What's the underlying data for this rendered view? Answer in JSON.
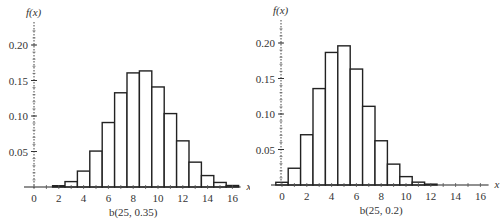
{
  "chart_data": [
    {
      "type": "bar",
      "title": "b(25, 0.35)",
      "xlabel": "x",
      "ylabel": "f(x)",
      "ylim": [
        0,
        0.23
      ],
      "xlim": [
        -0.5,
        16.5
      ],
      "x_ticks": [
        0,
        2,
        4,
        6,
        8,
        10,
        12,
        14,
        16
      ],
      "y_ticks": [
        "0.05",
        "0.10",
        "0.15",
        "0.20"
      ],
      "grid": false,
      "categories": [
        0,
        1,
        2,
        3,
        4,
        5,
        6,
        7,
        8,
        9,
        10,
        11,
        12,
        13,
        14,
        15,
        16
      ],
      "values": [
        0.0,
        0.0003,
        0.0018,
        0.0076,
        0.0224,
        0.0506,
        0.0908,
        0.1327,
        0.1607,
        0.1635,
        0.1409,
        0.1034,
        0.065,
        0.035,
        0.0161,
        0.0064,
        0.0021
      ]
    },
    {
      "type": "bar",
      "title": "b(25, 0.2)",
      "xlabel": "x",
      "ylabel": "f(x)",
      "ylim": [
        0,
        0.23
      ],
      "xlim": [
        -0.5,
        16.5
      ],
      "x_ticks": [
        0,
        2,
        4,
        6,
        8,
        10,
        12,
        14,
        16
      ],
      "y_ticks": [
        "0.05",
        "0.10",
        "0.15",
        "0.20"
      ],
      "grid": false,
      "categories": [
        0,
        1,
        2,
        3,
        4,
        5,
        6,
        7,
        8,
        9,
        10,
        11,
        12,
        13,
        14,
        15,
        16
      ],
      "values": [
        0.0038,
        0.0236,
        0.0708,
        0.1358,
        0.1867,
        0.196,
        0.1633,
        0.1108,
        0.0623,
        0.0294,
        0.0118,
        0.004,
        0.0012,
        0.0003,
        0.0001,
        0.0,
        0.0
      ]
    }
  ],
  "charts": [
    {
      "caption": "b(25, 0.35)",
      "ylabel": "f(x)",
      "xlabel": "x"
    },
    {
      "caption": "b(25, 0.2)",
      "ylabel": "f(x)",
      "xlabel": "x"
    }
  ]
}
